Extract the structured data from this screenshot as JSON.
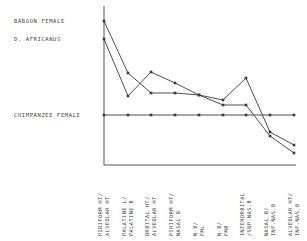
{
  "chart_data": {
    "type": "line",
    "title": "",
    "xlabel": "",
    "ylabel": "",
    "reference_series": "CHIMPANZEE FEMALE",
    "categories": [
      "PIRIFORM HT/ ALVEOLAR HT",
      "PALATINE L/ PALATINE B",
      "ORBITAL HT/ ALVEOLAR HT",
      "PIRIFORM HT/ NASAL B",
      "N-B/ FML",
      "N-B/ FMB",
      "INTERORBITAL /SUP.NAS.B",
      "NASAL B/ INF.NAS.B",
      "ALVEOLAR HT/ INF.NAS.B"
    ],
    "series": [
      {
        "name": "BABOON FEMALE",
        "values": [
          9.4,
          4.2,
          2.2,
          2.2,
          2.0,
          1.0,
          1.0,
          -2.1,
          -3.8
        ]
      },
      {
        "name": "D. AFRICANUS",
        "values": [
          7.6,
          1.9,
          4.3,
          3.2,
          2.0,
          1.5,
          3.7,
          -1.7,
          -3.0
        ]
      },
      {
        "name": "CHIMPANZEE FEMALE",
        "values": [
          0,
          0,
          0,
          0,
          0,
          0,
          0,
          0,
          0
        ]
      }
    ],
    "ylim": [
      -5,
      10.5
    ],
    "grid": false,
    "legend_position": "left, labels aligned with series start values"
  },
  "legend": {
    "baboon": "BABOON FEMALE",
    "africanus": "D. AFRICANUS",
    "chimp": "CHIMPANZEE FEMALE"
  },
  "xlabels": [
    "PIRIFORM HT/\nALVEOLAR HT",
    "PALATINE L/\nPALATINE B",
    "ORBITAL HT/\nALVEOLAR HT",
    "PIRIFORM HT/\nNASAL B",
    "N-B/\nFML",
    "N-B/\nFMB",
    "INTERORBITAL\n/SUP.NAS.B",
    "NASAL B/\nINF.NAS.B",
    "ALVEOLAR HT/\nINF.NAS.B"
  ],
  "colors": {
    "line": "#3a3a3a",
    "axis": "#555555"
  }
}
